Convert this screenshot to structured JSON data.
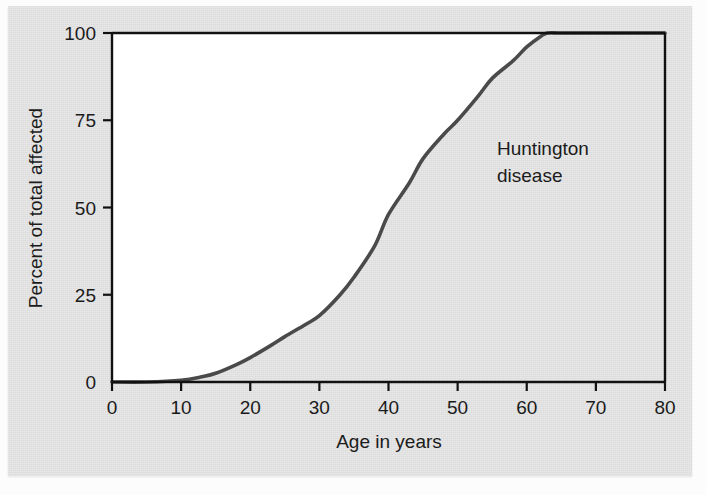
{
  "figure": {
    "background_color": "#dcdcdc",
    "plot_unfilled_color": "#ffffff",
    "curve_color": "#4a4a4a",
    "axis_color": "#111111",
    "text_color": "#1b1b1b"
  },
  "chart_data": {
    "type": "line",
    "title": "",
    "subtitle": "",
    "xlabel": "Age in years",
    "ylabel": "Percent of total affected",
    "xlim": [
      0,
      80
    ],
    "ylim": [
      0,
      100
    ],
    "xticks": [
      0,
      10,
      20,
      30,
      40,
      50,
      60,
      70,
      80
    ],
    "xtick_labels": [
      "0",
      "10",
      "20",
      "30",
      "40",
      "50",
      "60",
      "70",
      "80"
    ],
    "yticks": [
      0,
      25,
      50,
      75,
      100
    ],
    "ytick_labels": [
      "0",
      "25",
      "50",
      "75",
      "100"
    ],
    "grid": false,
    "legend_position": "inside-right",
    "annotations": [
      {
        "text_line_1": "Huntington",
        "text_line_2": "disease",
        "x": 54,
        "y": 62
      }
    ],
    "series": [
      {
        "name": "Huntington disease",
        "color": "#4a4a4a",
        "fill_below": true,
        "fill_color": "#dcdcdc",
        "x": [
          0,
          5,
          10,
          13,
          15,
          18,
          20,
          23,
          25,
          28,
          30,
          33,
          35,
          38,
          40,
          43,
          45,
          48,
          50,
          53,
          55,
          58,
          60,
          62,
          63,
          65,
          70,
          75,
          80
        ],
        "y": [
          0,
          0,
          0.5,
          1.5,
          2.5,
          5,
          7,
          10.5,
          13,
          16.5,
          19,
          25,
          30,
          39,
          48,
          57,
          64,
          71,
          75,
          82,
          87,
          92,
          96,
          99,
          100,
          100,
          100,
          100,
          100
        ]
      }
    ]
  },
  "labels": {
    "x_axis_title": "Age in years",
    "y_axis_title": "Percent of total affected",
    "annotation_line_1": "Huntington",
    "annotation_line_2": "disease"
  }
}
